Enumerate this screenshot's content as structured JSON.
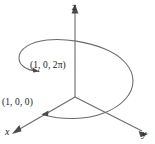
{
  "figure": {
    "background_color": "#ffffff",
    "axis_color": "#6b6b6b",
    "curve_color": "#6b6b6b",
    "text_color": "#1a1a1a"
  },
  "axes": {
    "z": {
      "label": "z",
      "icon": "axis-arrow-up"
    },
    "y": {
      "label": "y",
      "icon": "axis-arrow-right-down"
    },
    "x": {
      "label": "x",
      "icon": "axis-arrow-left-down"
    }
  },
  "points": [
    {
      "id": "helix_top",
      "label": "(1, 0, 2π)",
      "marker": "arrow-dot"
    },
    {
      "id": "helix_base",
      "label": "(1, 0, 0)",
      "marker": "arrow-dot"
    }
  ],
  "curve": {
    "name": "helix",
    "description": "single turn helix rising from (1, 0, 0) to (1, 0, 2π)"
  }
}
